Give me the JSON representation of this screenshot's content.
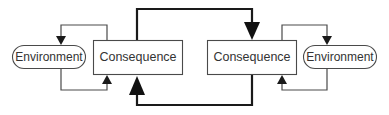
{
  "diagram": {
    "nodes": {
      "left_environment": {
        "label": "Environment",
        "shape": "stadium"
      },
      "left_consequence": {
        "label": "Consequence",
        "shape": "rectangle"
      },
      "right_consequence": {
        "label": "Consequence",
        "shape": "rectangle"
      },
      "right_environment": {
        "label": "Environment",
        "shape": "stadium"
      }
    },
    "edges": [
      {
        "from": "left_consequence",
        "to": "left_environment",
        "weight": "thin",
        "route": "over-top"
      },
      {
        "from": "left_environment",
        "to": "left_consequence",
        "weight": "thin",
        "route": "under-bottom"
      },
      {
        "from": "left_consequence",
        "to": "right_consequence",
        "weight": "thick",
        "route": "over-top"
      },
      {
        "from": "right_consequence",
        "to": "left_consequence",
        "weight": "thick",
        "route": "under-bottom"
      },
      {
        "from": "right_consequence",
        "to": "right_environment",
        "weight": "thin",
        "route": "over-top"
      },
      {
        "from": "right_environment",
        "to": "right_consequence",
        "weight": "thin",
        "route": "under-bottom"
      }
    ],
    "colors": {
      "stroke": "#4a4a4a",
      "thick_stroke": "#1a1a1a",
      "text": "#333333",
      "background": "#ffffff"
    }
  }
}
